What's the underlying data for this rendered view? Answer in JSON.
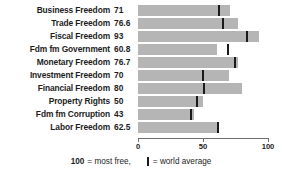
{
  "chart_data": {
    "type": "bar",
    "title": "",
    "xlabel": "",
    "ylabel": "",
    "orientation": "horizontal",
    "xlim": [
      0,
      100
    ],
    "grid": false,
    "legend_position": "bottom",
    "xticks": [
      {
        "value": 0,
        "label": "0"
      },
      {
        "value": 50,
        "label": "50"
      },
      {
        "value": 100,
        "label": "100"
      }
    ],
    "categories": [
      "Business Freedom",
      "Trade Freedom",
      "Fiscal Freedom",
      "Fdm fm Government",
      "Monetary Freedom",
      "Investment Freedom",
      "Financial Freedom",
      "Property Rights",
      "Fdm fm Corruption",
      "Labor Freedom"
    ],
    "values": [
      71,
      76.6,
      93,
      60.8,
      76.7,
      70,
      80,
      50,
      43,
      62.5
    ],
    "value_labels": [
      "71",
      "76.6",
      "93",
      "60.8",
      "76.7",
      "70",
      "80",
      "50",
      "43",
      "62.5"
    ],
    "series": [
      {
        "name": "Country score",
        "values": [
          71,
          76.6,
          93,
          60.8,
          76.7,
          70,
          80,
          50,
          43,
          62.5
        ]
      },
      {
        "name": "World average",
        "marker": "vertical-tick",
        "values": [
          62.5,
          65,
          84,
          69,
          74.5,
          50,
          51,
          45,
          40.5,
          61.5
        ]
      }
    ],
    "colors": {
      "bar": "#b5b5b5",
      "average_tick": "#1a1a1a",
      "axis": "#6e6e6e",
      "text": "#1d1d1d",
      "background": "#ffffff"
    }
  },
  "legend": {
    "scale_value": "100",
    "scale_text": "= most free,",
    "average_text": "= world average"
  }
}
